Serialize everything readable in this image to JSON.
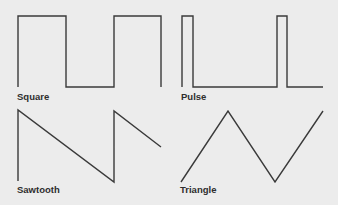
{
  "stroke_color": "#3a3a3a",
  "background_color": "#ececec",
  "waveforms": [
    {
      "name": "Square",
      "points": "18,87 18,16 66,16 66,87 114,87 114,16 161,16 161,87"
    },
    {
      "name": "Pulse",
      "points": "182,87 182,16 193,16 193,87 277,87 277,16 287,16 287,87 323,87"
    },
    {
      "name": "Sawtooth",
      "points": "18,181 18,110 114,182 114,111 161,147"
    },
    {
      "name": "Triangle",
      "points": "181,182 228,111 275,182 323,111"
    }
  ]
}
